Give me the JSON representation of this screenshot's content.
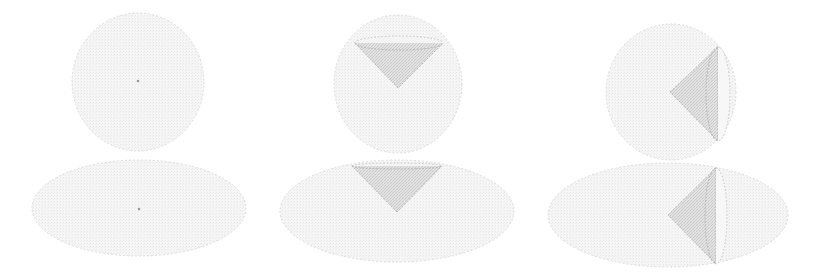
{
  "figure": {
    "width": 826,
    "height": 279,
    "colors": {
      "background": "#ffffff",
      "sphere_fill": "#f3f3f3",
      "sphere_stroke": "#dcdcdc",
      "cone_fill": "#d9d9d9",
      "cone_stroke": "#b5b5b5",
      "center_dot": "#9a9a9a"
    },
    "columns": [
      {
        "id": "plain",
        "sphere": {
          "cx": 138,
          "cy": 82,
          "rx": 66,
          "ry": 69
        },
        "ellipsoid": {
          "cx": 139,
          "cy": 208,
          "rx": 107,
          "ry": 48
        },
        "center_dot_sphere": {
          "cx": 138,
          "cy": 81
        },
        "center_dot_ellipsoid": {
          "cx": 139,
          "cy": 209
        }
      },
      {
        "id": "cone-up",
        "sphere": {
          "cx": 398,
          "cy": 84,
          "rx": 64,
          "ry": 69
        },
        "sphere_cone": {
          "apex": [
            398,
            88
          ],
          "base_cx": 399,
          "base_cy": 43,
          "base_rx": 44,
          "base_ry": 7,
          "orientation": "vertical"
        },
        "ellipsoid": {
          "cx": 397,
          "cy": 211,
          "rx": 117,
          "ry": 51
        },
        "ellipsoid_cone": {
          "apex": [
            397,
            212
          ],
          "base_cx": 397,
          "base_cy": 166,
          "base_rx": 45,
          "base_ry": 3,
          "orientation": "vertical"
        }
      },
      {
        "id": "cone-right",
        "sphere": {
          "cx": 671,
          "cy": 92,
          "rx": 65,
          "ry": 68
        },
        "sphere_cone": {
          "apex": [
            670,
            92
          ],
          "base_cx": 718,
          "base_cy": 94,
          "base_rx": 12,
          "base_ry": 47,
          "orientation": "horizontal"
        },
        "ellipsoid": {
          "cx": 668,
          "cy": 215,
          "rx": 120,
          "ry": 52
        },
        "ellipsoid_cone": {
          "apex": [
            668,
            215
          ],
          "base_cx": 716,
          "base_cy": 216,
          "base_rx": 11,
          "base_ry": 48,
          "orientation": "horizontal"
        }
      }
    ]
  }
}
